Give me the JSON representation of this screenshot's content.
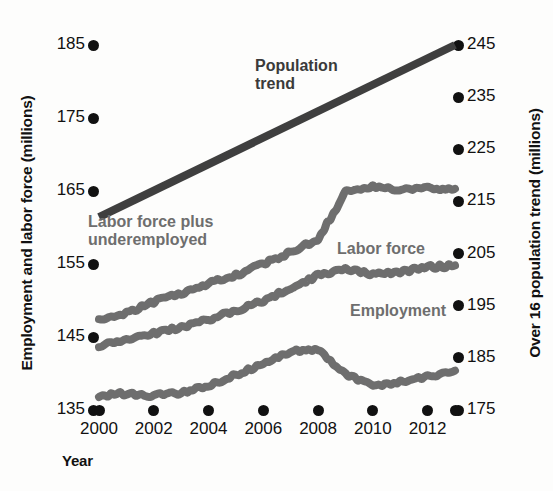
{
  "chart_data": {
    "type": "line",
    "title": "",
    "xlabel": "Year",
    "ylabel_left": "Employment and labor force (millions)",
    "ylabel_right": "Over 16 population trend (millions)",
    "grid": false,
    "legend_position": "inline-annotations",
    "x": [
      2000,
      2001,
      2002,
      2003,
      2004,
      2005,
      2006,
      2007,
      2008,
      2009,
      2010,
      2011,
      2012,
      2013
    ],
    "xlim": [
      2000,
      2013
    ],
    "xticks": [
      2000,
      2002,
      2004,
      2006,
      2008,
      2010,
      2012
    ],
    "xtick_labels": [
      "2000",
      "2002",
      "2004",
      "2006",
      "2008",
      "2010",
      "2012"
    ],
    "ylim_left": [
      135,
      185
    ],
    "yticks_left": [
      135,
      145,
      155,
      165,
      175,
      185
    ],
    "ytick_labels_left": [
      "135",
      "145",
      "155",
      "165",
      "175",
      "185"
    ],
    "ylim_right": [
      175,
      245
    ],
    "yticks_right": [
      175,
      185,
      195,
      205,
      215,
      225,
      235,
      245
    ],
    "ytick_labels_right": [
      "175",
      "185",
      "195",
      "205",
      "215",
      "225",
      "235",
      "245"
    ],
    "series": [
      {
        "name": "Population trend",
        "axis": "right",
        "style": "straight-line",
        "color": "#3f3f3f",
        "values": [
          212.0,
          214.7,
          217.4,
          220.2,
          222.9,
          225.6,
          228.3,
          231.1,
          233.8,
          236.5,
          239.2,
          242.0,
          244.7,
          245.0
        ]
      },
      {
        "name": "Labor force plus underemployed",
        "axis": "left",
        "style": "wavy-line",
        "color": "#6e6e6e",
        "values": [
          147.2,
          148.3,
          149.8,
          151.0,
          152.3,
          153.5,
          155.0,
          156.6,
          158.4,
          164.8,
          165.6,
          165.2,
          165.4,
          165.3
        ]
      },
      {
        "name": "Labor force",
        "axis": "left",
        "style": "wavy-line",
        "color": "#6e6e6e",
        "values": [
          143.8,
          144.6,
          145.5,
          146.3,
          147.4,
          148.6,
          150.0,
          151.7,
          153.4,
          154.2,
          153.6,
          153.9,
          154.6,
          154.8
        ]
      },
      {
        "name": "Employment",
        "axis": "left",
        "style": "wavy-line",
        "color": "#6e6e6e",
        "values": [
          136.9,
          137.3,
          137.0,
          137.4,
          138.4,
          139.8,
          141.4,
          143.0,
          143.3,
          139.9,
          138.3,
          138.8,
          139.6,
          140.4
        ]
      }
    ],
    "annotations": [
      {
        "name": "population-trend",
        "text": "Population\ntrend"
      },
      {
        "name": "labor-force-plus-underemployed",
        "text": "Labor force plus\nunderemployed"
      },
      {
        "name": "labor-force",
        "text": "Labor force"
      },
      {
        "name": "employment",
        "text": "Employment"
      }
    ],
    "colors": {
      "background": "#fdfdfc",
      "series_gray": "#6e6e6e",
      "trend_dark": "#3f3f3f",
      "tick_black": "#111111",
      "label_gray": "#6e6e6e"
    }
  }
}
